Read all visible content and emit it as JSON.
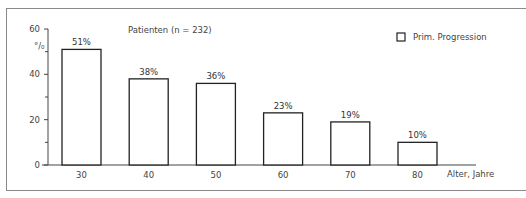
{
  "chart_data": {
    "type": "bar",
    "title": "Patienten (n = 232)",
    "xlabel": "Alter, Jahre",
    "ylabel": "%",
    "ylim": [
      0,
      60
    ],
    "yticks": [
      0,
      20,
      40,
      60
    ],
    "yminor_ticks": [
      10,
      30,
      50
    ],
    "categories": [
      "30",
      "40",
      "50",
      "60",
      "70",
      "80"
    ],
    "series": [
      {
        "name": "Prim. Progression",
        "values": [
          51,
          38,
          36,
          23,
          19,
          10
        ]
      }
    ],
    "value_labels": [
      "51%",
      "38%",
      "36%",
      "23%",
      "19%",
      "10%"
    ],
    "legend": {
      "position": "top-right",
      "entries": [
        "Prim. Progression"
      ]
    },
    "grid": false
  },
  "colors": {
    "bar_fill": "#ffffff",
    "bar_stroke": "#222222",
    "axis": "#444444",
    "text": "#444444"
  }
}
